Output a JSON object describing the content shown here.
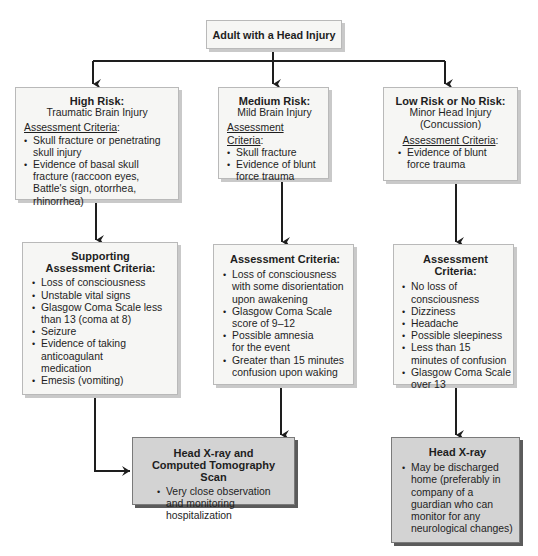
{
  "root": {
    "title": "Adult with a Head Injury"
  },
  "high_risk": {
    "title": "High Risk:",
    "subtitle": "Traumatic Brain Injury",
    "criteria_label": "Assessment Criteria",
    "criteria_colon": ":",
    "items": [
      "Skull fracture or penetrating skull injury",
      "Evidence of basal skull fracture (raccoon eyes, Battle's sign, otorrhea, rhinorrhea)"
    ]
  },
  "medium_risk": {
    "title": "Medium Risk:",
    "subtitle": "Mild Brain Injury",
    "criteria_label": "Assessment Criteria",
    "criteria_colon": ":",
    "items": [
      "Skull fracture",
      "Evidence of blunt force trauma"
    ]
  },
  "low_risk": {
    "title": "Low Risk or No Risk:",
    "subtitle_1": "Minor Head Injury",
    "subtitle_2": "(Concussion)",
    "criteria_label": "Assessment Criteria",
    "criteria_colon": ":",
    "items": [
      "Evidence of blunt force trauma"
    ]
  },
  "high_support": {
    "title": "Supporting Assessment Criteria:",
    "items": [
      "Loss of consciousness",
      "Unstable vital signs",
      "Glasgow Coma Scale less than 13 (coma at 8)",
      "Seizure",
      "Evidence of taking anticoagulant medication",
      "Emesis (vomiting)"
    ]
  },
  "medium_assess": {
    "title": "Assessment Criteria:",
    "items": [
      "Loss of consciousness with some disorientation upon awakening",
      "Glasgow Coma Scale score of 9–12",
      "Possible amnesia for the event",
      "Greater than 15 minutes confusion upon waking"
    ]
  },
  "low_assess": {
    "title": "Assessment Criteria:",
    "items": [
      "No loss of consciousness",
      "Dizziness",
      "Headache",
      "Possible sleepiness",
      "Less than 15 minutes of confusion",
      "Glasgow Coma Scale over 13"
    ]
  },
  "ct_outcome": {
    "title_1": "Head X-ray and",
    "title_2": "Computed Tomography Scan",
    "items": [
      "Very close observation and monitoring hospitalization"
    ]
  },
  "xray_outcome": {
    "title": "Head X-ray",
    "items": [
      "May be discharged home (preferably in company of a guardian who can monitor for any neurological changes)"
    ]
  },
  "colors": {
    "box_fill": "#f6f6f4",
    "outcome_fill": "#d3d3d3",
    "line": "#1e1e1e"
  }
}
